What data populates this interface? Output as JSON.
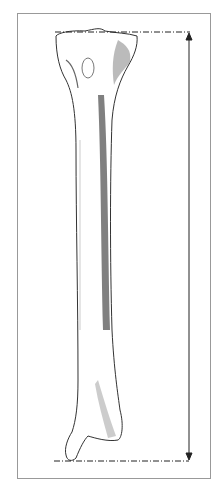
{
  "figure": {
    "measurement": "length",
    "colors": {
      "frame": "#999999",
      "ink": "#222222",
      "shading": "#555555"
    }
  }
}
